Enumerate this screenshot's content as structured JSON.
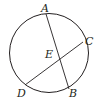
{
  "diagram": {
    "type": "circle-with-intersecting-chords",
    "circle": {
      "cx": 49,
      "cy": 53,
      "r": 40
    },
    "points": {
      "A": {
        "x": 46,
        "y": 14,
        "label": "A"
      },
      "B": {
        "x": 69,
        "y": 88,
        "label": "B"
      },
      "C": {
        "x": 84,
        "y": 42,
        "label": "C"
      },
      "D": {
        "x": 25,
        "y": 85,
        "label": "D"
      },
      "E": {
        "x": 59,
        "y": 59,
        "label": "E"
      }
    },
    "chords": [
      "AB",
      "CD"
    ],
    "labels": {
      "A": "A",
      "B": "B",
      "C": "C",
      "D": "D",
      "E": "E"
    },
    "stroke_color": "#231f20"
  }
}
